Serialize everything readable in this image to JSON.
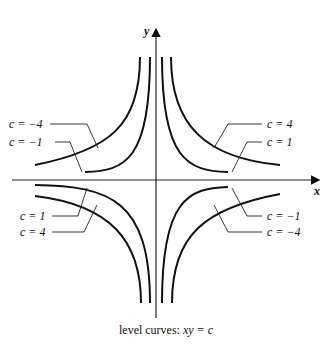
{
  "axes": {
    "x_label": "x",
    "y_label": "y"
  },
  "caption": {
    "prefix": "level curves: ",
    "equation": "xy = c"
  },
  "labels": {
    "ul_outer": "c = −4",
    "ul_inner": "c = −1",
    "ur_outer": "c = 4",
    "ur_inner": "c = 1",
    "ll_inner": "c = 1",
    "ll_outer": "c = 4",
    "lr_inner": "c = −1",
    "lr_outer": "c = −4"
  },
  "curves": [
    {
      "c": 1,
      "quadrants": [
        "I",
        "III"
      ]
    },
    {
      "c": 4,
      "quadrants": [
        "I",
        "III"
      ]
    },
    {
      "c": -1,
      "quadrants": [
        "II",
        "IV"
      ]
    },
    {
      "c": -4,
      "quadrants": [
        "II",
        "IV"
      ]
    }
  ]
}
